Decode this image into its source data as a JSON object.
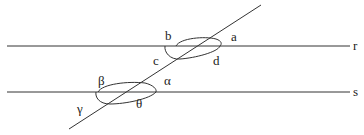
{
  "diagram": {
    "colors": {
      "line": "#333333",
      "text": "#222222",
      "background": "#ffffff"
    },
    "lines": {
      "r": {
        "label": "r"
      },
      "s": {
        "label": "s"
      }
    },
    "top_intersection_angles": {
      "a": "a",
      "b": "b",
      "c": "c",
      "d": "d"
    },
    "bottom_intersection_angles": {
      "alpha": "α",
      "beta": "β",
      "gamma": "γ",
      "theta": "θ"
    }
  }
}
